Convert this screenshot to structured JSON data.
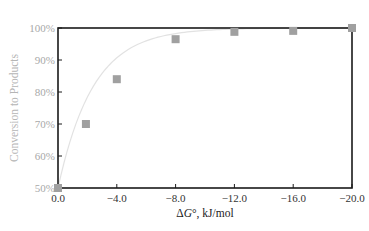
{
  "chart_data": {
    "type": "scatter",
    "title": "",
    "xlabel": "ΔG°, kJ/mol",
    "xlabel_parts": {
      "delta": "Δ",
      "G": "G",
      "rest": "°, kJ/mol"
    },
    "ylabel": "Conversion to Products",
    "xlim": [
      0.0,
      -20.0
    ],
    "ylim": [
      50,
      100
    ],
    "x_ticks": [
      0.0,
      -4.0,
      -8.0,
      -12.0,
      -16.0,
      -20.0
    ],
    "x_tick_labels": [
      "0.0",
      "−4.0",
      "−8.0",
      "−12.0",
      "−16.0",
      "−20.0"
    ],
    "y_ticks": [
      50,
      60,
      70,
      80,
      90,
      100
    ],
    "y_tick_labels": [
      "50%",
      "60%",
      "70%",
      "80%",
      "90%",
      "100%"
    ],
    "grid": false,
    "legend": null,
    "series": [
      {
        "name": "Conversion",
        "marker": "square",
        "marker_color": "#a0a0a0",
        "line_color": "#e2e2e2",
        "x": [
          0.0,
          -1.9,
          -4.0,
          -8.0,
          -12.0,
          -16.0,
          -20.0
        ],
        "y": [
          50,
          70,
          84,
          96.5,
          98.8,
          99.1,
          100
        ]
      }
    ]
  },
  "colors": {
    "axis": "#1a1a1a",
    "curve": "#e2e2e2",
    "marker": "#a0a0a0",
    "ytick_text": "#a8a8a8",
    "xtick_text": "#333333"
  }
}
